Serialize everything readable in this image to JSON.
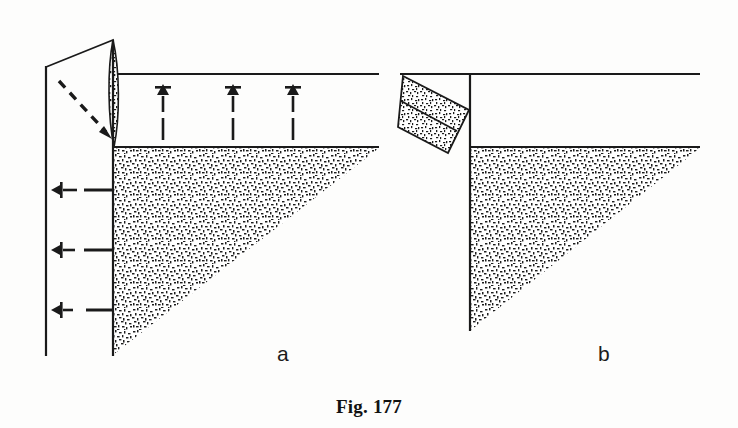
{
  "figure": {
    "caption": "Fig. 177",
    "panels": [
      {
        "id": "a",
        "label": "a"
      },
      {
        "id": "b",
        "label": "b"
      }
    ],
    "colors": {
      "ink": "#1a1a1a",
      "paper": "#fdfdfc",
      "speckle": "#222222"
    }
  },
  "diagram_data": {
    "type": "diagram",
    "subject": "retaining wall earth pressure failure wedge",
    "panel_a": {
      "elements": [
        {
          "name": "wall-line-left",
          "kind": "line",
          "x1": 46,
          "y1": 66,
          "x2": 46,
          "y2": 356
        },
        {
          "name": "wall-line-right",
          "kind": "line",
          "x1": 113,
          "y1": 40,
          "x2": 113,
          "y2": 356
        },
        {
          "name": "ground-line-upper",
          "kind": "line",
          "x1": 117,
          "y1": 74,
          "x2": 379,
          "y2": 74
        },
        {
          "name": "ground-line-lower",
          "kind": "line",
          "x1": 113,
          "y1": 146,
          "x2": 379,
          "y2": 146
        },
        {
          "name": "wedge-outline",
          "kind": "polyline",
          "points": "46,66 113,40 113,140 46,66"
        },
        {
          "name": "pressure-sliver",
          "kind": "lens",
          "x": 113,
          "y_top": 40,
          "y_bottom": 146,
          "max_half_width": 7
        },
        {
          "name": "soil-wedge-triangle",
          "kind": "triangle",
          "points": "114,148 379,148 114,354"
        },
        {
          "name": "dashed-rotation-arrow",
          "kind": "dashed-arrow",
          "x1": 60,
          "y1": 82,
          "x2": 110,
          "y2": 136
        },
        {
          "name": "uplift-arrow-1",
          "kind": "arrow-up",
          "x": 163,
          "y_head": 86,
          "y_tail": 136
        },
        {
          "name": "uplift-arrow-2",
          "kind": "arrow-up",
          "x": 233,
          "y_head": 86,
          "y_tail": 136
        },
        {
          "name": "uplift-arrow-3",
          "kind": "arrow-up",
          "x": 293,
          "y_head": 86,
          "y_tail": 136
        },
        {
          "name": "lateral-arrow-1",
          "kind": "arrow-left",
          "y": 190,
          "x_head": 52,
          "x_tail": 112
        },
        {
          "name": "lateral-arrow-2",
          "kind": "arrow-left",
          "y": 250,
          "x_head": 52,
          "x_tail": 112
        },
        {
          "name": "lateral-arrow-3",
          "kind": "arrow-left",
          "y": 310,
          "x_head": 52,
          "x_tail": 112
        }
      ]
    },
    "panel_b": {
      "elements": [
        {
          "name": "ground-line-upper",
          "kind": "line",
          "x1": 400,
          "y1": 74,
          "x2": 700,
          "y2": 74
        },
        {
          "name": "ground-line-lower",
          "kind": "line",
          "x1": 470,
          "y1": 146,
          "x2": 700,
          "y2": 146
        },
        {
          "name": "wall-line-vertical",
          "kind": "line",
          "x1": 470,
          "y1": 74,
          "x2": 470,
          "y2": 330
        },
        {
          "name": "tilted-slab",
          "kind": "parallelogram",
          "points": "403,76 468,110 448,152 398,127"
        },
        {
          "name": "slab-center-line",
          "kind": "line",
          "x1": 400,
          "y1": 100,
          "x2": 458,
          "y2": 130
        },
        {
          "name": "soil-wedge-triangle",
          "kind": "triangle",
          "points": "471,148 700,148 471,330"
        }
      ]
    }
  }
}
